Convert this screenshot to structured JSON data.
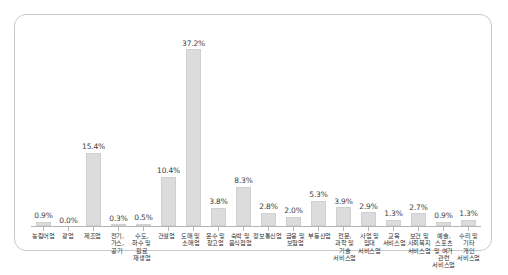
{
  "chart_data": {
    "type": "bar",
    "title": "",
    "subtitle": "",
    "xlabel": "",
    "ylabel": "",
    "ylim": [
      0,
      40
    ],
    "grid": false,
    "legend": null,
    "value_suffix": "%",
    "bar_color": "#dcdcdc",
    "bar_border_color": "#d0d0d0",
    "axis_color": "#b5b5b5",
    "panel_border_color": "#c9c9c9",
    "label_color": "#3c3c3c",
    "categories": [
      "농림어업",
      "광업",
      "제조업",
      "전기,가스, 공기",
      "수도,하수 및 원료 재생업",
      "건설업",
      "도매 및 소매업",
      "운수 및 창고업",
      "숙박 및 음식점업",
      "정보통신업",
      "금융 및 보험업",
      "부동산업",
      "전문,과학 및 기술 서비스업",
      "사업 및 임대 서비스업",
      "교육 서비스업",
      "보건 및 사회복지 서비스업",
      "예술,스포츠 및 여가 관련 서비스업",
      "수리 및 기타 개인 서비스업"
    ],
    "values": [
      0.9,
      0.0,
      15.4,
      0.3,
      0.5,
      10.4,
      37.2,
      3.8,
      8.3,
      2.8,
      2.0,
      5.3,
      3.9,
      2.9,
      1.3,
      2.7,
      0.9,
      1.3
    ],
    "value_labels": [
      "0.9%",
      "0.0%",
      "15.4%",
      "0.3%",
      "0.5%",
      "10.4%",
      "37.2%",
      "3.8%",
      "8.3%",
      "2.8%",
      "2.0%",
      "5.3%",
      "3.9%",
      "2.9%",
      "1.3%",
      "2.7%",
      "0.9%",
      "1.3%"
    ]
  }
}
